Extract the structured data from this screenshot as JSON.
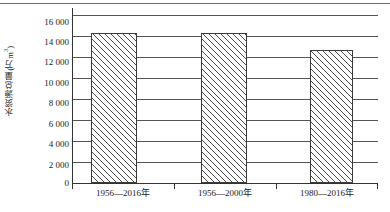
{
  "chart_data": {
    "type": "bar",
    "title": "",
    "xlabel": "",
    "ylabel": "水资源总量(万m³)",
    "ylabel_text": "水资源总量(万m",
    "ylabel_sup": "3",
    "ylabel_tail": ")",
    "categories": [
      "1956—2016年",
      "1956—2000年",
      "1980—2016年"
    ],
    "values": [
      14300,
      14300,
      12700
    ],
    "ylim": [
      0,
      16000
    ],
    "yticks": [
      0,
      2000,
      4000,
      6000,
      8000,
      10000,
      12000,
      14000,
      16000
    ],
    "ytick_labels": [
      "0",
      "2 000",
      "4 000",
      "6 000",
      "8 000",
      "10 000",
      "12 000",
      "14 000",
      "16 000"
    ],
    "grid": true,
    "legend": "none",
    "series": [
      {
        "name": "水资源总量",
        "values": [
          14300,
          14300,
          12700
        ],
        "fill": "hatch-diagonal",
        "fill_color": "#ffffff",
        "edge_color": "#3a3a3a"
      }
    ]
  },
  "axes": {
    "y_tick_0": "0",
    "y_tick_1": "2 000",
    "y_tick_2": "4 000",
    "y_tick_3": "6 000",
    "y_tick_4": "8 000",
    "y_tick_5": "10 000",
    "y_tick_6": "12 000",
    "y_tick_7": "14 000",
    "y_tick_8": "16 000",
    "x_cat_0": "1956—2016年",
    "x_cat_1": "1956—2000年",
    "x_cat_2": "1980—2016年"
  },
  "colors": {
    "grid": "#555555",
    "axis": "#333333",
    "bar_edge": "#3a3a3a",
    "bar_fill": "#ffffff",
    "text": "#1c1c1c",
    "top_rule": "#6b6b6b"
  }
}
